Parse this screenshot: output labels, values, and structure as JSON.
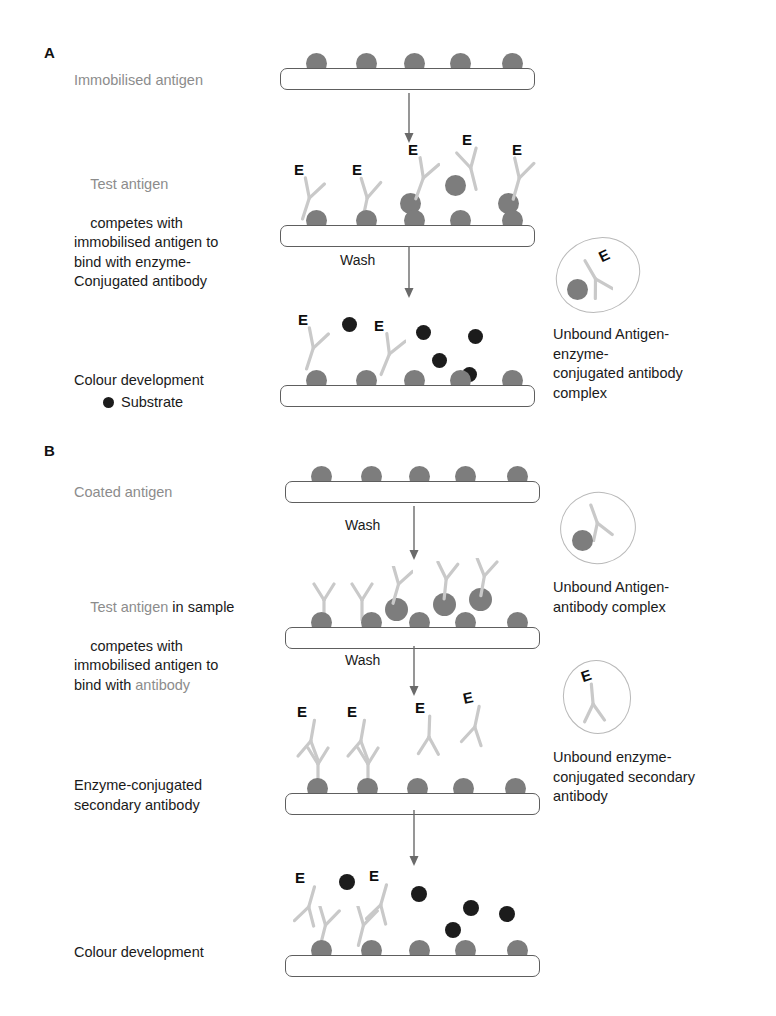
{
  "figure": {
    "panels": [
      "A",
      "B"
    ],
    "caption": ""
  },
  "panelA": {
    "letter": "A",
    "steps": [
      {
        "label_plain": "Immobilised antigen",
        "label_grey": "Immobilised antigen",
        "label_black": "",
        "antigens": 5,
        "antibodies": 0,
        "substrates": 0
      },
      {
        "label_grey": "Test antigen",
        "label_black": "competes with\nimmobilised antigen to\nbind with enzyme-\nConjugated antibody",
        "antigens": 5,
        "antibodies": 5,
        "substrates": 0
      },
      {
        "label_grey": "",
        "label_black": "Colour development",
        "antigens": 5,
        "antibodies": 2,
        "substrates": 5
      }
    ],
    "arrow_labels": [
      "",
      "Wash"
    ],
    "legend": {
      "symbol": "substrate-dot",
      "text": "Substrate"
    },
    "callout": {
      "text": "Unbound Antigen-\nenzyme-\nconjugated antibody\ncomplex",
      "contents": [
        "enzyme-conjugated-antibody",
        "antigen"
      ],
      "enzyme_letter": "E"
    },
    "enzyme_letter": "E"
  },
  "panelB": {
    "letter": "B",
    "steps": [
      {
        "label_grey": "Coated antigen",
        "label_black": "",
        "antigens": 5,
        "antibodies": 0,
        "secondary": 0,
        "substrates": 0
      },
      {
        "label_grey_1": "Test antigen",
        "label_black_1": " in sample",
        "label_black_2": "competes with\nimmobilised antigen to\nbind with ",
        "label_grey_2": "antibody",
        "antigens": 5,
        "antibodies": 5,
        "secondary": 0,
        "substrates": 0
      },
      {
        "label_grey": "",
        "label_black": "Enzyme-conjugated\nsecondary antibody",
        "antigens": 5,
        "antibodies": 2,
        "secondary": 4,
        "substrates": 0
      },
      {
        "label_grey": "",
        "label_black": "Colour development",
        "antigens": 5,
        "antibodies": 2,
        "secondary": 2,
        "substrates": 5
      }
    ],
    "arrow_labels": [
      "Wash",
      "Wash",
      ""
    ],
    "callouts": [
      {
        "text": "Unbound Antigen-\nantibody complex",
        "contents": [
          "antibody",
          "antigen"
        ],
        "enzyme_letter": ""
      },
      {
        "text": "Unbound enzyme-\nconjugated secondary\nantibody",
        "contents": [
          "enzyme-conjugated-antibody"
        ],
        "enzyme_letter": "E"
      }
    ],
    "enzyme_letter": "E"
  },
  "colors": {
    "antigen": "#7d7d7d",
    "substrate": "#1c1c1c",
    "plate_border": "#5e5e5e",
    "antibody": "#d6d6d6",
    "antibody_stroke": "#bdbdbd",
    "grey_text": "#8c8c8c",
    "black_text": "#1a1a1a",
    "callout_border": "#b9b9b9",
    "arrow": "#6a6a6a"
  }
}
